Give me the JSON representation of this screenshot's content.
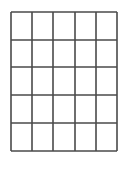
{
  "figure": {
    "name": "blank-grid",
    "title": "",
    "caption": "",
    "background_color": "#ffffff",
    "line_color": "#4a4a4a",
    "line_color_light": "#8e8e8e",
    "canvas": {
      "width": 129,
      "height": 185
    }
  },
  "chart_data": {
    "type": "table",
    "title": "",
    "xlabel": "",
    "ylabel": "",
    "grid": true,
    "legend": "none",
    "rows": 5,
    "columns": 5,
    "cells": [
      [
        "",
        "",
        "",
        "",
        ""
      ],
      [
        "",
        "",
        "",
        "",
        ""
      ],
      [
        "",
        "",
        "",
        "",
        ""
      ],
      [
        "",
        "",
        "",
        "",
        ""
      ],
      [
        "",
        "",
        "",
        "",
        ""
      ]
    ],
    "column_headers": [
      "",
      "",
      "",
      "",
      ""
    ],
    "row_headers": [
      "",
      "",
      "",
      "",
      ""
    ],
    "vertical_line_x": [
      11,
      32,
      53,
      75,
      96,
      117
    ],
    "horizontal_line_y": [
      12,
      40,
      67,
      95,
      123,
      151
    ],
    "vertical_overrun_bottom_y": 172,
    "line_width_vertical": 1.6,
    "line_width_horizontal": 1.6,
    "xlim": [
      11,
      117
    ],
    "ylim": [
      12,
      151
    ]
  }
}
